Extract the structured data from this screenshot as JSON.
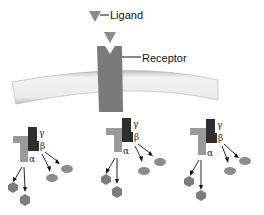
{
  "labels": {
    "ligand": "Ligand",
    "receptor": "Receptor",
    "gamma": "γ",
    "beta": "β",
    "alpha": "α"
  },
  "colors": {
    "ligand": "#8a8a8a",
    "receptor": "#7a7a7a",
    "alpha_subunit": "#9a9a9a",
    "beta_gamma_subunit": "#2e2e2e",
    "effector_hexagon": "#7d7d7d",
    "effector_oval": "#8c8c8c",
    "membrane": "#e6e6e6"
  },
  "g_proteins": [
    {
      "id": "left"
    },
    {
      "id": "middle"
    },
    {
      "id": "right"
    }
  ]
}
